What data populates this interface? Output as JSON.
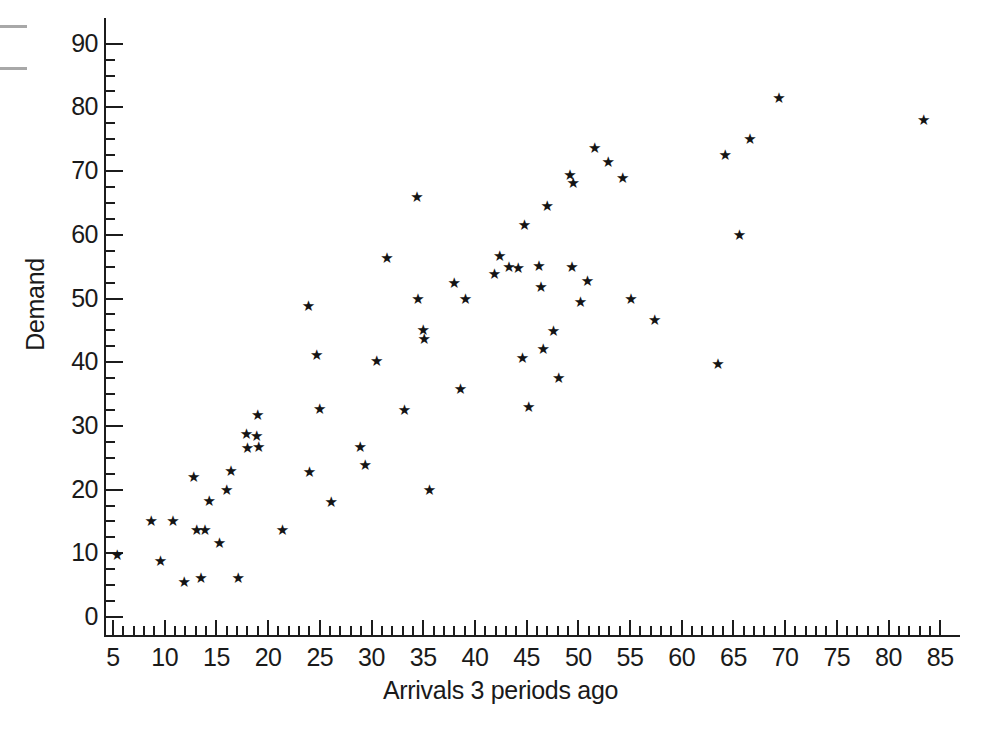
{
  "chart_data": {
    "type": "scatter",
    "title": "",
    "xlabel": "Arrivals 3 periods ago",
    "ylabel": "Demand",
    "xlim": [
      3.5,
      86.5
    ],
    "ylim": [
      -2.5,
      93
    ],
    "grid": false,
    "legend": null,
    "marker": "star",
    "marker_color": "#141414",
    "xticks": [
      5,
      10,
      15,
      20,
      25,
      30,
      35,
      40,
      45,
      50,
      55,
      60,
      65,
      70,
      75,
      80,
      85
    ],
    "xtick_labels": [
      "5",
      "10",
      "15",
      "20",
      "25",
      "30",
      "35",
      "40",
      "45",
      "50",
      "55",
      "60",
      "65",
      "70",
      "75",
      "80",
      "85"
    ],
    "xminor_step": 1,
    "yticks": [
      0,
      10,
      20,
      30,
      40,
      50,
      60,
      70,
      80,
      90
    ],
    "ytick_labels": [
      "0",
      "10",
      "20",
      "30",
      "40",
      "50",
      "60",
      "70",
      "80",
      "90"
    ],
    "yminor_step": 2.5,
    "points": [
      [
        5.4,
        10.0
      ],
      [
        8.7,
        15.4
      ],
      [
        9.6,
        9.1
      ],
      [
        10.8,
        15.4
      ],
      [
        11.9,
        5.8
      ],
      [
        12.8,
        22.3
      ],
      [
        13.1,
        13.9
      ],
      [
        13.5,
        6.5
      ],
      [
        13.9,
        13.9
      ],
      [
        14.3,
        18.5
      ],
      [
        15.3,
        12.0
      ],
      [
        16.0,
        20.2
      ],
      [
        16.4,
        23.2
      ],
      [
        17.1,
        6.4
      ],
      [
        17.9,
        29.0
      ],
      [
        18.0,
        26.9
      ],
      [
        18.9,
        28.8
      ],
      [
        19.0,
        32.0
      ],
      [
        19.1,
        27.0
      ],
      [
        21.4,
        14.0
      ],
      [
        23.9,
        49.2
      ],
      [
        24.0,
        23.1
      ],
      [
        24.7,
        41.4
      ],
      [
        25.0,
        32.9
      ],
      [
        26.1,
        18.4
      ],
      [
        28.9,
        27.0
      ],
      [
        29.4,
        24.2
      ],
      [
        30.5,
        40.5
      ],
      [
        31.5,
        56.7
      ],
      [
        33.2,
        32.8
      ],
      [
        34.4,
        66.2
      ],
      [
        34.5,
        50.3
      ],
      [
        35.0,
        45.3
      ],
      [
        35.1,
        43.9
      ],
      [
        35.6,
        20.2
      ],
      [
        38.0,
        52.8
      ],
      [
        38.6,
        36.1
      ],
      [
        39.1,
        50.2
      ],
      [
        41.9,
        54.2
      ],
      [
        42.4,
        57.0
      ],
      [
        43.3,
        55.2
      ],
      [
        44.2,
        55.1
      ],
      [
        44.6,
        41.0
      ],
      [
        44.8,
        61.9
      ],
      [
        45.2,
        33.3
      ],
      [
        46.2,
        55.4
      ],
      [
        46.4,
        52.1
      ],
      [
        46.6,
        42.4
      ],
      [
        47.0,
        64.9
      ],
      [
        47.6,
        45.2
      ],
      [
        48.1,
        37.9
      ],
      [
        49.2,
        69.7
      ],
      [
        49.4,
        55.2
      ],
      [
        49.5,
        68.5
      ],
      [
        50.2,
        49.7
      ],
      [
        50.9,
        53.0
      ],
      [
        51.6,
        74.0
      ],
      [
        52.9,
        71.8
      ],
      [
        54.3,
        69.2
      ],
      [
        55.1,
        50.3
      ],
      [
        57.4,
        47.0
      ],
      [
        63.5,
        40.0
      ],
      [
        64.2,
        72.8
      ],
      [
        65.6,
        60.3
      ],
      [
        66.6,
        75.3
      ],
      [
        69.4,
        81.8
      ],
      [
        83.4,
        78.3
      ]
    ]
  },
  "axes": {
    "x_title": "Arrivals 3 periods ago",
    "y_title": "Demand"
  }
}
